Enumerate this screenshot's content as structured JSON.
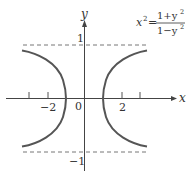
{
  "figure": {
    "equation": {
      "lhs": "x",
      "lhs_exp": "2",
      "equals": "=",
      "numerator": "1+y",
      "numerator_exp": "2",
      "denominator": "1−y",
      "denominator_exp": "2"
    },
    "axes": {
      "x_label": "x",
      "y_label": "y",
      "origin_label": "0",
      "x_tick_labels": [
        "−2",
        "2"
      ],
      "y_tick_labels": [
        "1",
        "−1"
      ]
    },
    "asymptotes": [
      "y = 1",
      "y = −1"
    ],
    "colors": {
      "curve": "#555555",
      "axis": "#444444",
      "dashed": "#777777",
      "text": "#333333"
    }
  }
}
